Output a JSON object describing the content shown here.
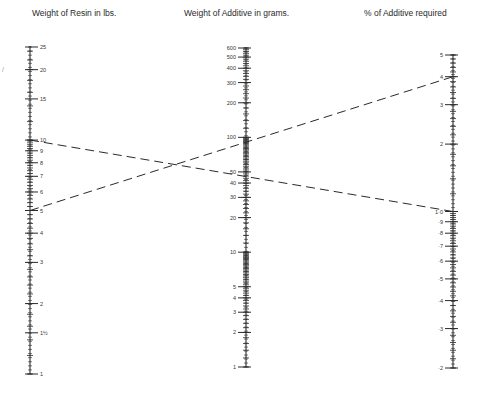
{
  "titles": {
    "left": "Weight of Resin in lbs.",
    "middle": "Weight of Additive in grams.",
    "right": "% of Additive required"
  },
  "stray_mark": "/",
  "colors": {
    "ink": "#2a2a2a",
    "background": "#ffffff"
  },
  "axes": {
    "left": {
      "x": 30,
      "min": 1,
      "max": 25,
      "y_min": 374,
      "y_max": 47,
      "scale": "log",
      "labels": [
        {
          "v": 25,
          "t": "25"
        },
        {
          "v": 20,
          "t": "20"
        },
        {
          "v": 15,
          "t": "15"
        },
        {
          "v": 10,
          "t": "10"
        },
        {
          "v": 9,
          "t": "9"
        },
        {
          "v": 8,
          "t": "8"
        },
        {
          "v": 7,
          "t": "7"
        },
        {
          "v": 6,
          "t": "6"
        },
        {
          "v": 5,
          "t": "5"
        },
        {
          "v": 4,
          "t": "4"
        },
        {
          "v": 3,
          "t": "3"
        },
        {
          "v": 2,
          "t": "2"
        },
        {
          "v": 1.5,
          "t": "1½"
        },
        {
          "v": 1,
          "t": "1"
        }
      ]
    },
    "middle": {
      "x": 246,
      "min": 1,
      "max": 600,
      "y_min": 367,
      "y_max": 48,
      "scale": "log",
      "labels": [
        {
          "v": 600,
          "t": "600"
        },
        {
          "v": 500,
          "t": "500"
        },
        {
          "v": 400,
          "t": "400"
        },
        {
          "v": 300,
          "t": "300"
        },
        {
          "v": 200,
          "t": "200"
        },
        {
          "v": 100,
          "t": "100"
        },
        {
          "v": 50,
          "t": "50"
        },
        {
          "v": 40,
          "t": "40"
        },
        {
          "v": 30,
          "t": "30"
        },
        {
          "v": 20,
          "t": "20"
        },
        {
          "v": 10,
          "t": "10"
        },
        {
          "v": 5,
          "t": "5"
        },
        {
          "v": 4,
          "t": "4"
        },
        {
          "v": 3,
          "t": "3"
        },
        {
          "v": 2,
          "t": "2"
        },
        {
          "v": 1,
          "t": "1"
        }
      ]
    },
    "right": {
      "x": 453,
      "min": 0.2,
      "max": 5,
      "y_min": 368,
      "y_max": 55,
      "scale": "log",
      "labels": [
        {
          "v": 5,
          "t": "5"
        },
        {
          "v": 4,
          "t": "4"
        },
        {
          "v": 3,
          "t": "3"
        },
        {
          "v": 2,
          "t": "2"
        },
        {
          "v": 1.0,
          "t": "1·0"
        },
        {
          "v": 0.9,
          "t": "·9"
        },
        {
          "v": 0.8,
          "t": "·8"
        },
        {
          "v": 0.7,
          "t": "·7"
        },
        {
          "v": 0.6,
          "t": "·6"
        },
        {
          "v": 0.5,
          "t": "·5"
        },
        {
          "v": 0.4,
          "t": "·4"
        },
        {
          "v": 0.3,
          "t": "·3"
        },
        {
          "v": 0.2,
          "t": "·2"
        }
      ]
    }
  },
  "example_lines": [
    {
      "from_resin_lbs": 10,
      "to_percent": 1.0,
      "reads_grams": 45
    },
    {
      "from_resin_lbs": 5,
      "to_percent": 4,
      "reads_grams": 90
    }
  ]
}
